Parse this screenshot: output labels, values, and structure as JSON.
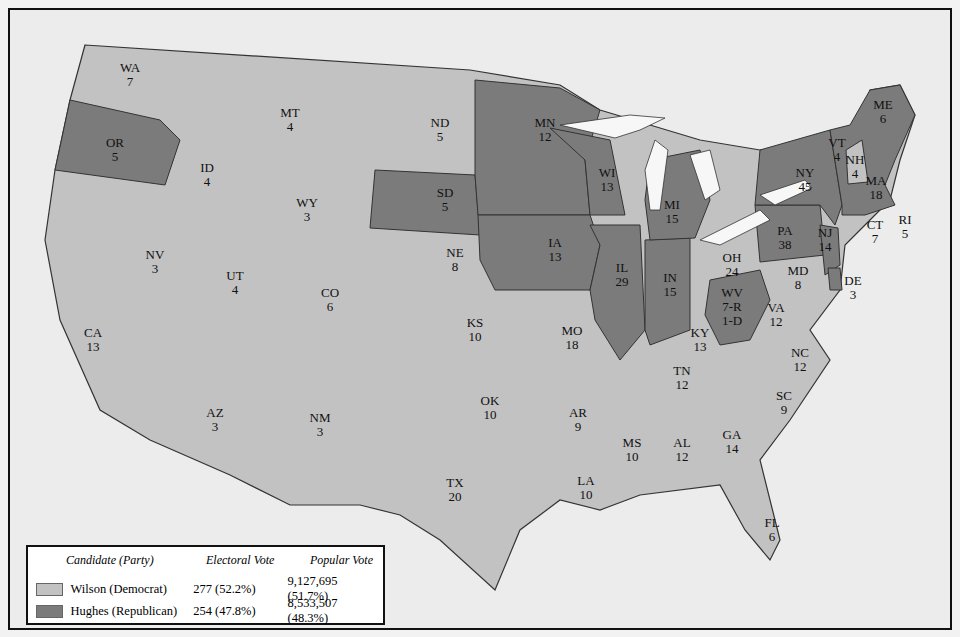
{
  "colors": {
    "democrat": "#c2c2c2",
    "republican": "#7b7b7b",
    "water": "#f7f7f7",
    "border": "#333333"
  },
  "states": [
    {
      "abbr": "WA",
      "votes": "7",
      "party": "D",
      "x": 130,
      "y": 75
    },
    {
      "abbr": "OR",
      "votes": "5",
      "party": "R",
      "x": 115,
      "y": 150
    },
    {
      "abbr": "CA",
      "votes": "13",
      "party": "D",
      "x": 93,
      "y": 340
    },
    {
      "abbr": "NV",
      "votes": "3",
      "party": "D",
      "x": 155,
      "y": 262
    },
    {
      "abbr": "ID",
      "votes": "4",
      "party": "D",
      "x": 207,
      "y": 175
    },
    {
      "abbr": "MT",
      "votes": "4",
      "party": "D",
      "x": 290,
      "y": 120
    },
    {
      "abbr": "WY",
      "votes": "3",
      "party": "D",
      "x": 307,
      "y": 210
    },
    {
      "abbr": "UT",
      "votes": "4",
      "party": "D",
      "x": 235,
      "y": 283
    },
    {
      "abbr": "AZ",
      "votes": "3",
      "party": "D",
      "x": 215,
      "y": 420
    },
    {
      "abbr": "CO",
      "votes": "6",
      "party": "D",
      "x": 330,
      "y": 300
    },
    {
      "abbr": "NM",
      "votes": "3",
      "party": "D",
      "x": 320,
      "y": 425
    },
    {
      "abbr": "ND",
      "votes": "5",
      "party": "D",
      "x": 440,
      "y": 130
    },
    {
      "abbr": "SD",
      "votes": "5",
      "party": "R",
      "x": 445,
      "y": 200
    },
    {
      "abbr": "NE",
      "votes": "8",
      "party": "D",
      "x": 455,
      "y": 260
    },
    {
      "abbr": "KS",
      "votes": "10",
      "party": "D",
      "x": 475,
      "y": 330
    },
    {
      "abbr": "OK",
      "votes": "10",
      "party": "D",
      "x": 490,
      "y": 408
    },
    {
      "abbr": "TX",
      "votes": "20",
      "party": "D",
      "x": 455,
      "y": 490
    },
    {
      "abbr": "MN",
      "votes": "12",
      "party": "R",
      "x": 545,
      "y": 130
    },
    {
      "abbr": "IA",
      "votes": "13",
      "party": "R",
      "x": 555,
      "y": 250
    },
    {
      "abbr": "MO",
      "votes": "18",
      "party": "D",
      "x": 572,
      "y": 338
    },
    {
      "abbr": "AR",
      "votes": "9",
      "party": "D",
      "x": 578,
      "y": 420
    },
    {
      "abbr": "LA",
      "votes": "10",
      "party": "D",
      "x": 586,
      "y": 488
    },
    {
      "abbr": "WI",
      "votes": "13",
      "party": "R",
      "x": 607,
      "y": 180
    },
    {
      "abbr": "IL",
      "votes": "29",
      "party": "R",
      "x": 622,
      "y": 275
    },
    {
      "abbr": "MI",
      "votes": "15",
      "party": "R",
      "x": 672,
      "y": 212
    },
    {
      "abbr": "IN",
      "votes": "15",
      "party": "R",
      "x": 670,
      "y": 285
    },
    {
      "abbr": "OH",
      "votes": "24",
      "party": "D",
      "x": 732,
      "y": 265
    },
    {
      "abbr": "KY",
      "votes": "13",
      "party": "D",
      "x": 700,
      "y": 340
    },
    {
      "abbr": "TN",
      "votes": "12",
      "party": "D",
      "x": 682,
      "y": 378
    },
    {
      "abbr": "MS",
      "votes": "10",
      "party": "D",
      "x": 632,
      "y": 450
    },
    {
      "abbr": "AL",
      "votes": "12",
      "party": "D",
      "x": 682,
      "y": 450
    },
    {
      "abbr": "GA",
      "votes": "14",
      "party": "D",
      "x": 732,
      "y": 442
    },
    {
      "abbr": "FL",
      "votes": "6",
      "party": "D",
      "x": 772,
      "y": 530
    },
    {
      "abbr": "SC",
      "votes": "9",
      "party": "D",
      "x": 784,
      "y": 403
    },
    {
      "abbr": "NC",
      "votes": "12",
      "party": "D",
      "x": 800,
      "y": 360
    },
    {
      "abbr": "VA",
      "votes": "12",
      "party": "D",
      "x": 776,
      "y": 315
    },
    {
      "abbr": "WV",
      "votes": "7-R\n1-D",
      "party": "R",
      "x": 732,
      "y": 300
    },
    {
      "abbr": "MD",
      "votes": "8",
      "party": "D",
      "x": 798,
      "y": 278
    },
    {
      "abbr": "DE",
      "votes": "3",
      "party": "R",
      "x": 853,
      "y": 288
    },
    {
      "abbr": "PA",
      "votes": "38",
      "party": "R",
      "x": 785,
      "y": 238
    },
    {
      "abbr": "NJ",
      "votes": "14",
      "party": "R",
      "x": 825,
      "y": 240
    },
    {
      "abbr": "NY",
      "votes": "45",
      "party": "R",
      "x": 805,
      "y": 180
    },
    {
      "abbr": "VT",
      "votes": "4",
      "party": "R",
      "x": 837,
      "y": 150
    },
    {
      "abbr": "NH",
      "votes": "4",
      "party": "D",
      "x": 855,
      "y": 167
    },
    {
      "abbr": "ME",
      "votes": "6",
      "party": "R",
      "x": 883,
      "y": 112
    },
    {
      "abbr": "MA",
      "votes": "18",
      "party": "R",
      "x": 876,
      "y": 188
    },
    {
      "abbr": "RI",
      "votes": "5",
      "party": "R",
      "x": 905,
      "y": 227
    },
    {
      "abbr": "CT",
      "votes": "7",
      "party": "R",
      "x": 875,
      "y": 232
    }
  ],
  "legend": {
    "headers": [
      "Candidate (Party)",
      "Electoral Vote",
      "Popular Vote"
    ],
    "rows": [
      {
        "candidate": "Wilson (Democrat)",
        "electoral": "277 (52.2%)",
        "popular": "9,127,695 (51.7%)",
        "party": "D"
      },
      {
        "candidate": "Hughes (Republican)",
        "electoral": "254 (47.8%)",
        "popular": "8,533,507 (48.3%)",
        "party": "R"
      }
    ]
  }
}
